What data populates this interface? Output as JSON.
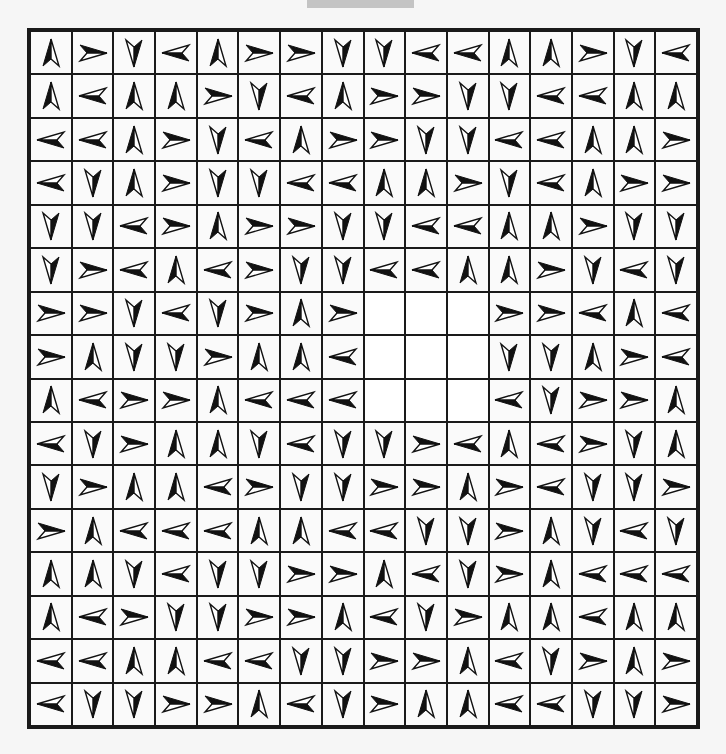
{
  "puzzle": {
    "rows": 16,
    "cols": 16,
    "legend": {
      "U": "arrow-up",
      "R": "arrow-right",
      "D": "arrow-down",
      "L": "arrow-left",
      "_": "empty"
    },
    "colors": {
      "grid_line": "#1a1a1a",
      "cell_bg": "#fafafa",
      "arrow_fill": "#111111",
      "top_tab": "#c4c4c4"
    },
    "grid": [
      "URDLURRDDLLUURDL",
      "ULUURDLURRDDLLUU",
      "LLURDLURRDDLLUUR",
      "LDURDDLLUURDLURR",
      "DDLRURRDDLLUURDD",
      "DRLULRDDLLUURDLD",
      "RRDLDRUR___RRLUL",
      "RUDDRUUL___DDURL",
      "ULRRULLL___LDRRU",
      "LDRUUDLDDRLULRDU",
      "DRUULRDDRRURLDDR",
      "RULLLUULLDDRUDLD",
      "UUDLDDRRULDRULLL",
      "ULRDDRRULDRUULUU",
      "LLUULLDDRRULDRUR",
      "LDDRRULDRUULLDDR"
    ]
  }
}
